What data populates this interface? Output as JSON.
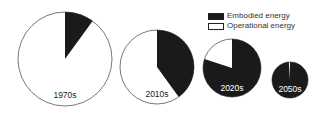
{
  "chart_data": {
    "type": "pie",
    "title": "",
    "legend": {
      "position": "top-right",
      "entries": [
        {
          "label": "Embodied energy",
          "color": "#1a1a1a"
        },
        {
          "label": "Operational energy",
          "color": "#ffffff"
        }
      ]
    },
    "series_names": [
      "Embodied energy",
      "Operational energy"
    ],
    "pies": [
      {
        "label": "1970s",
        "embodied_pct": 10,
        "operational_pct": 90,
        "relative_size": 1.0
      },
      {
        "label": "2010s",
        "embodied_pct": 40,
        "operational_pct": 60,
        "relative_size": 0.79
      },
      {
        "label": "2020s",
        "embodied_pct": 80,
        "operational_pct": 20,
        "relative_size": 0.62
      },
      {
        "label": "2050s",
        "embodied_pct": 99,
        "operational_pct": 1,
        "relative_size": 0.38
      }
    ]
  },
  "layout": {
    "pies": [
      {
        "cx": 65,
        "cy": 59,
        "r": 47,
        "label_y": 98
      },
      {
        "cx": 157,
        "cy": 67,
        "r": 37,
        "label_y": 97
      },
      {
        "cx": 232,
        "cy": 68,
        "r": 29,
        "label_y": 91
      },
      {
        "cx": 290,
        "cy": 80,
        "r": 18,
        "label_y": 92
      }
    ]
  }
}
